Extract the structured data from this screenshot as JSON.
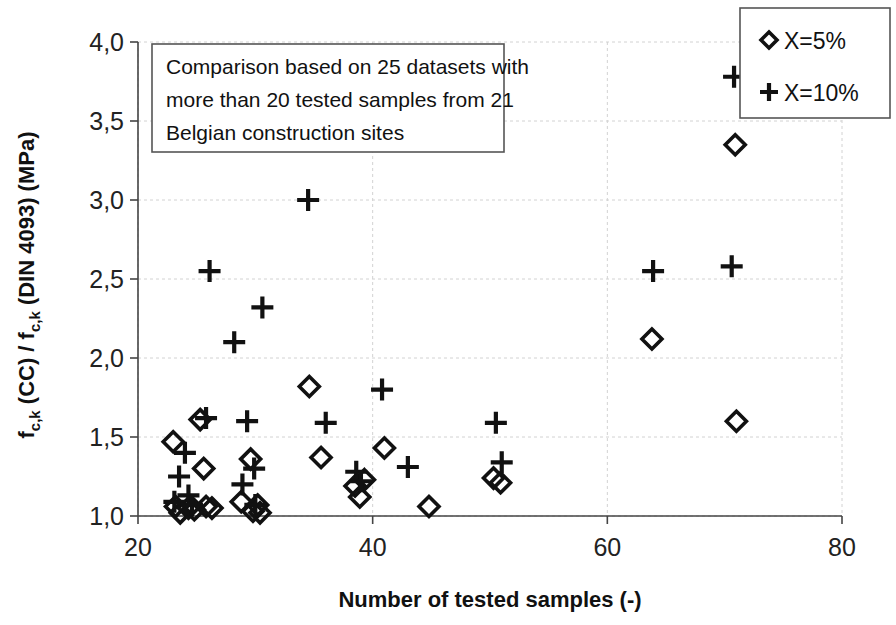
{
  "chart_data": {
    "type": "scatter",
    "title": "",
    "xlabel": "Number of tested samples (-)",
    "ylabel": "f_c,k (CC) / f_c,k (DIN 4093) (MPa)",
    "xlim": [
      20,
      80
    ],
    "ylim": [
      1.0,
      4.0
    ],
    "xticks": [
      20,
      40,
      60,
      80
    ],
    "xtick_labels": [
      "20",
      "40",
      "60",
      "80"
    ],
    "yticks": [
      1.0,
      1.5,
      2.0,
      2.5,
      3.0,
      3.5,
      4.0
    ],
    "ytick_labels": [
      "1,0",
      "1,5",
      "2,0",
      "2,5",
      "3,0",
      "3,5",
      "4,0"
    ],
    "grid": true,
    "legend_position": "top-right",
    "annotation": {
      "line1": "Comparison based on 25 datasets with",
      "line2": "more than 20 tested samples from 21",
      "line3": "Belgian construction sites"
    },
    "series": [
      {
        "name": "X=5%",
        "marker": "diamond",
        "color": "#111111",
        "points": [
          [
            23.0,
            1.47
          ],
          [
            23.2,
            1.06
          ],
          [
            23.6,
            1.02
          ],
          [
            24.3,
            1.05
          ],
          [
            24.8,
            1.04
          ],
          [
            25.3,
            1.61
          ],
          [
            25.6,
            1.3
          ],
          [
            25.8,
            1.06
          ],
          [
            26.3,
            1.05
          ],
          [
            28.8,
            1.09
          ],
          [
            29.6,
            1.36
          ],
          [
            29.8,
            1.03
          ],
          [
            30.2,
            1.07
          ],
          [
            30.4,
            1.02
          ],
          [
            34.6,
            1.82
          ],
          [
            35.6,
            1.37
          ],
          [
            38.5,
            1.19
          ],
          [
            38.9,
            1.12
          ],
          [
            39.3,
            1.23
          ],
          [
            41.0,
            1.43
          ],
          [
            44.8,
            1.06
          ],
          [
            50.3,
            1.24
          ],
          [
            50.9,
            1.21
          ],
          [
            63.8,
            2.12
          ],
          [
            70.9,
            3.35
          ],
          [
            71.0,
            1.6
          ]
        ]
      },
      {
        "name": "X=10%",
        "marker": "plus",
        "color": "#111111",
        "points": [
          [
            23.1,
            1.09
          ],
          [
            23.5,
            1.25
          ],
          [
            24.0,
            1.4
          ],
          [
            24.3,
            1.13
          ],
          [
            24.6,
            1.07
          ],
          [
            25.8,
            1.62
          ],
          [
            26.1,
            2.55
          ],
          [
            28.2,
            2.1
          ],
          [
            28.9,
            1.2
          ],
          [
            29.3,
            1.6
          ],
          [
            29.9,
            1.3
          ],
          [
            30.0,
            1.07
          ],
          [
            30.6,
            2.32
          ],
          [
            34.5,
            3.0
          ],
          [
            36.0,
            1.59
          ],
          [
            38.6,
            1.28
          ],
          [
            39.0,
            1.22
          ],
          [
            40.8,
            1.8
          ],
          [
            43.0,
            1.31
          ],
          [
            50.5,
            1.59
          ],
          [
            51.0,
            1.34
          ],
          [
            63.9,
            2.55
          ],
          [
            70.6,
            2.58
          ],
          [
            70.8,
            3.78
          ]
        ]
      }
    ]
  },
  "legend": {
    "items": [
      {
        "symbol": "diamond",
        "label": "X=5%"
      },
      {
        "symbol": "plus",
        "label": "X=10%"
      }
    ]
  },
  "axis": {
    "x_title": "Number of tested samples (-)",
    "y_title_parts": [
      "f",
      "c,k",
      " (CC) / f",
      "c,k",
      " (DIN 4093) (MPa)"
    ]
  }
}
